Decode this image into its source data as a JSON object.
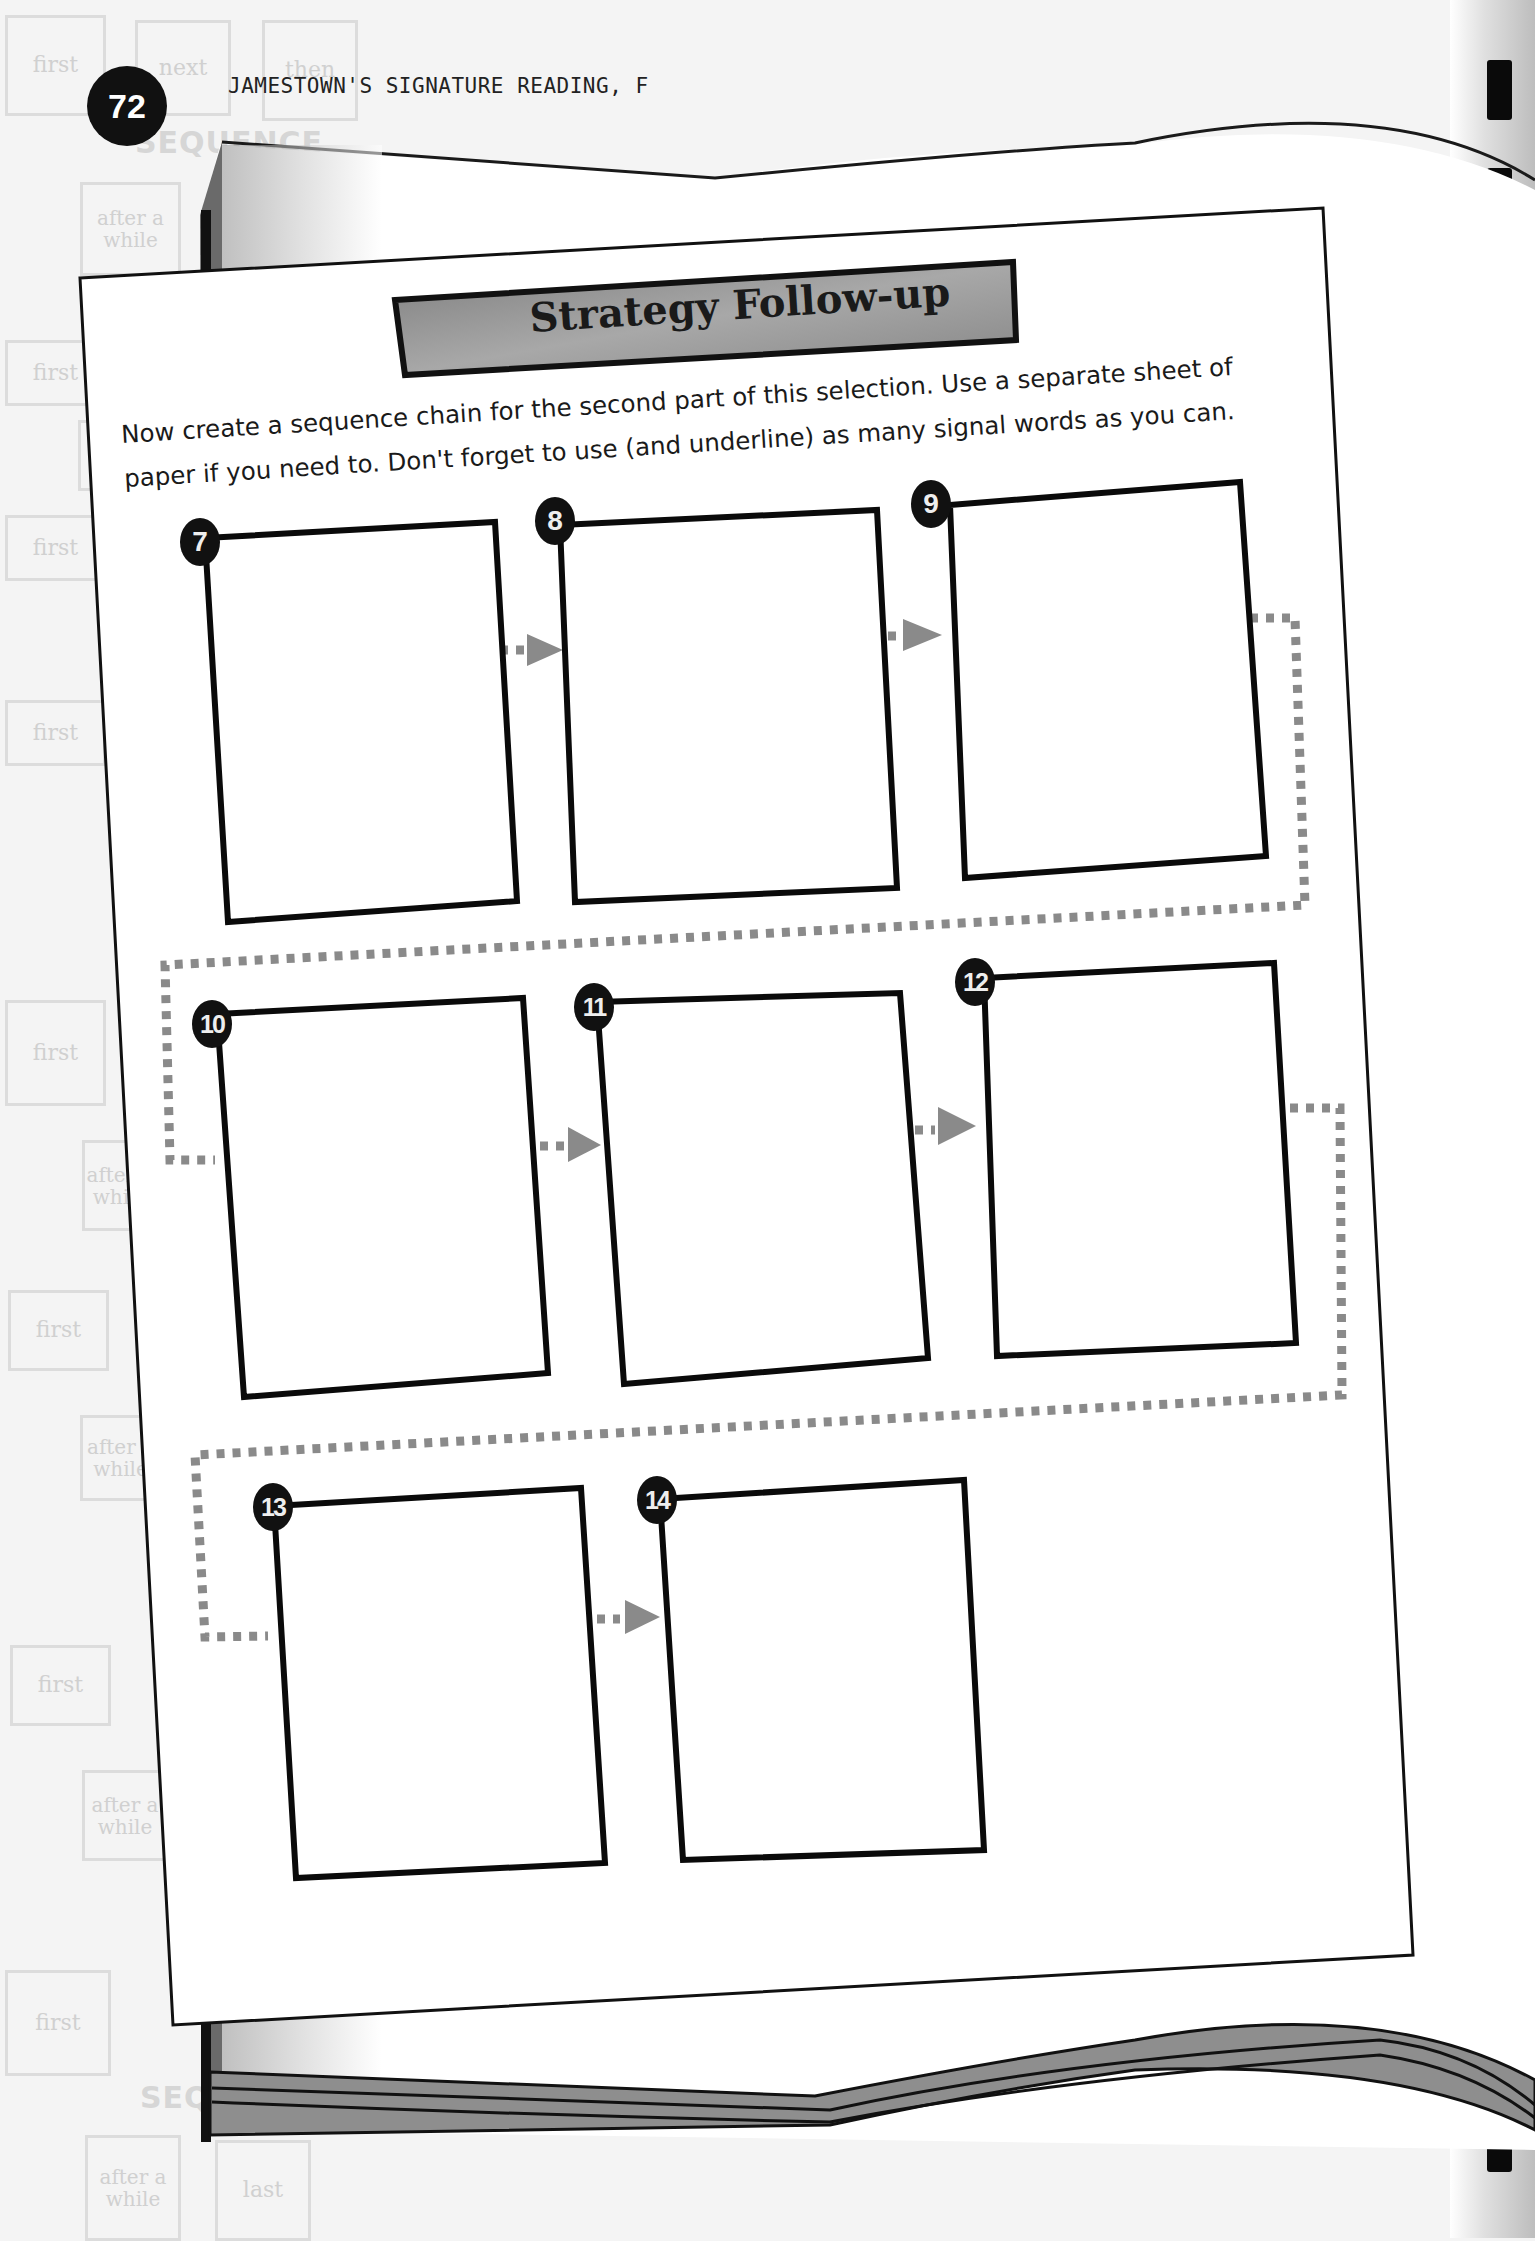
{
  "header": {
    "page_number": "72",
    "running_head": "JAMESTOWN'S SIGNATURE READING, F"
  },
  "background_watermark": {
    "top_row": [
      "first",
      "next",
      "then"
    ],
    "sequence_label": "SEQUENCE",
    "labels": [
      "first",
      "after a while",
      "first",
      "a",
      "first",
      "after a while",
      "first",
      "after a while",
      "first",
      "after a while",
      "first",
      "after a while",
      "last"
    ]
  },
  "sheet": {
    "title": "Strategy Follow-up",
    "instructions_line1": "Now create a sequence chain for the second part of this selection. Use a separate sheet of",
    "instructions_line2": "paper if you need to. Don't forget to use (and underline) as many signal words as you can.",
    "boxes": [
      {
        "number": "7"
      },
      {
        "number": "8"
      },
      {
        "number": "9"
      },
      {
        "number": "10"
      },
      {
        "number": "11"
      },
      {
        "number": "12"
      },
      {
        "number": "13"
      },
      {
        "number": "14"
      }
    ]
  },
  "colors": {
    "banner_fill": "#8f8f8f",
    "connector": "#8a8a8a",
    "badge": "#111111",
    "binding_dash": "#0a0a0a"
  }
}
